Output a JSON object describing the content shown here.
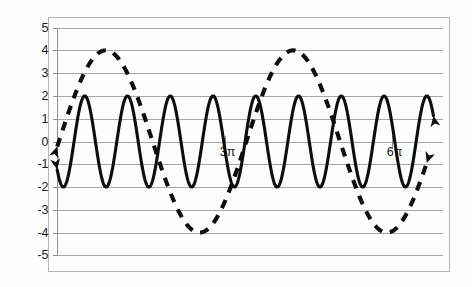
{
  "chart_data": {
    "type": "line",
    "title": "",
    "subtitle": "",
    "xlabel": "",
    "ylabel": "",
    "xlim": [
      0,
      6.9115
    ],
    "ylim": [
      -5,
      5
    ],
    "grid": true,
    "legend": null,
    "legend_position": "none",
    "background_color": "#ffffff",
    "line_color": "#0d0d0d",
    "grid_color": "#a6a6a6",
    "axis_color": "#8f8f8f",
    "y_ticks": [
      5,
      4,
      3,
      2,
      1,
      0,
      -1,
      -2,
      -3,
      -4,
      -5
    ],
    "y_tick_labels": [
      "5",
      "4",
      "3",
      "2",
      "1",
      "0",
      "-1",
      "-2",
      "-3",
      "-4",
      "-5"
    ],
    "x_ticks": [
      3.0,
      6.0
    ],
    "x_tick_labels": [
      "3π",
      "6π"
    ],
    "x_unit": "π radians",
    "series": [
      {
        "name": "high-frequency-wave",
        "style": "solid",
        "amplitude": 2,
        "period_units": 0.7667,
        "phase_description": "starts near -2 at left edge, rising",
        "function": "y = 2*sin(2*pi*(x - 0.105)/0.7667 - pi/2)",
        "n_visible_peaks": 7,
        "peak_value": 2,
        "trough_value": -2,
        "arrow_start": true,
        "arrow_end": true
      },
      {
        "name": "low-frequency-wave",
        "style": "dashed",
        "amplitude": 4,
        "period_units": 3.3613,
        "phase_description": "rises from about -0.6 at left edge to peak 4, trough -4, second peak 4",
        "function": "y = 4*sin(2*pi*(x - 0.105)/3.3613 + 0.15)",
        "n_visible_peaks": 2,
        "peak_value": 4,
        "trough_value": -4,
        "arrow_start": true,
        "arrow_end": true
      }
    ],
    "annotations": [
      {
        "text": "3π",
        "x": 3.0,
        "y": -0.6,
        "role": "x-axis-tick-label"
      },
      {
        "text": "6π",
        "x": 6.0,
        "y": -0.95,
        "role": "x-axis-tick-label"
      }
    ]
  },
  "figure": {
    "name": "trigonometric-waves-plot"
  }
}
